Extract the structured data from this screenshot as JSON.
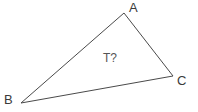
{
  "figure": {
    "type": "triangle-diagram",
    "background_color": "#ffffff",
    "stroke_color": "#4a4a4a",
    "stroke_width": 1,
    "label_color": "#3a3a3a",
    "interior_label_color": "#555555",
    "width": 198,
    "height": 112
  },
  "triangle": {
    "name": "triangle-ABC",
    "points_attr": "124,13 21,103 173,76",
    "vertices": [
      {
        "id": "A",
        "label": "A",
        "x": 124,
        "y": 13
      },
      {
        "id": "B",
        "label": "B",
        "x": 21,
        "y": 103
      },
      {
        "id": "C",
        "label": "C",
        "x": 173,
        "y": 76
      }
    ],
    "edges": [
      {
        "id": "AB",
        "from": "A",
        "to": "B"
      },
      {
        "id": "BC",
        "from": "B",
        "to": "C"
      },
      {
        "id": "CA",
        "from": "C",
        "to": "A"
      }
    ]
  },
  "labels": {
    "vertex_a": "A",
    "vertex_b": "B",
    "vertex_c": "C",
    "interior": "T?"
  }
}
